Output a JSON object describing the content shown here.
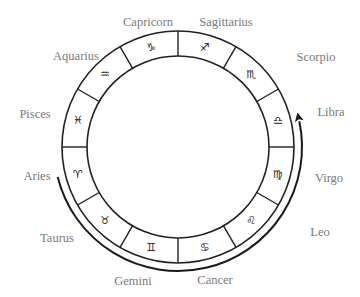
{
  "diagram": {
    "center": [
      178,
      147
    ],
    "outer_radius": 116,
    "inner_radius": 91,
    "motion_arc_radius": 124,
    "stroke_color": "#222222",
    "label_color": "#7a7a7a"
  },
  "signs": [
    {
      "name": "Capricorn",
      "symbol": "♑",
      "label_x": 148,
      "label_y": 26
    },
    {
      "name": "Sagittarius",
      "symbol": "♐",
      "label_x": 226,
      "label_y": 26
    },
    {
      "name": "Scorpio",
      "symbol": "♏",
      "label_x": 316,
      "label_y": 61
    },
    {
      "name": "Libra",
      "symbol": "♎",
      "label_x": 331,
      "label_y": 116
    },
    {
      "name": "Virgo",
      "symbol": "♍",
      "label_x": 329,
      "label_y": 182
    },
    {
      "name": "Leo",
      "symbol": "♌",
      "label_x": 320,
      "label_y": 236
    },
    {
      "name": "Cancer",
      "symbol": "♋",
      "label_x": 215,
      "label_y": 284
    },
    {
      "name": "Gemini",
      "symbol": "♊",
      "label_x": 133,
      "label_y": 285
    },
    {
      "name": "Taurus",
      "symbol": "♉",
      "label_x": 57,
      "label_y": 242
    },
    {
      "name": "Aries",
      "symbol": "♈",
      "label_x": 37,
      "label_y": 180
    },
    {
      "name": "Pisces",
      "symbol": "♓",
      "label_x": 35,
      "label_y": 118
    },
    {
      "name": "Aquarius",
      "symbol": "♒",
      "label_x": 76,
      "label_y": 60
    }
  ],
  "motion_arrow": {
    "description": "Apparent motion arrow from Aries around bottom to Libra",
    "start_near": "Aries",
    "end_near": "Libra"
  }
}
